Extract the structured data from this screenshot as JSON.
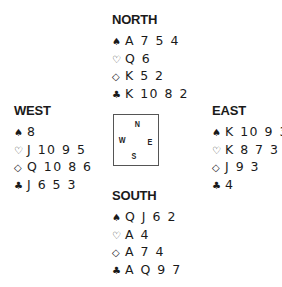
{
  "hands": {
    "north": {
      "title": "NORTH",
      "spades": "A 7 5 4",
      "hearts": "Q 6",
      "diamonds": "K 5 2",
      "clubs": "K 10 8 2"
    },
    "west": {
      "title": "WEST",
      "spades": "8",
      "hearts": "J 10 9 5",
      "diamonds": "Q 10 8 6",
      "clubs": "J 6 5 3"
    },
    "east": {
      "title": "EAST",
      "spades": "K 10 9 3",
      "hearts": "K 8 7 3 2",
      "diamonds": "J 9 3",
      "clubs": "4"
    },
    "south": {
      "title": "SOUTH",
      "spades": "Q J 6 2",
      "hearts": "A 4",
      "diamonds": "A 7 4",
      "clubs": "A Q 9 7"
    }
  },
  "suit_icons": {
    "spades": "♠",
    "hearts": "♡",
    "diamonds": "◇",
    "clubs": "♣"
  },
  "compass": {
    "n": "N",
    "w": "W",
    "e": "E",
    "s": "S"
  }
}
